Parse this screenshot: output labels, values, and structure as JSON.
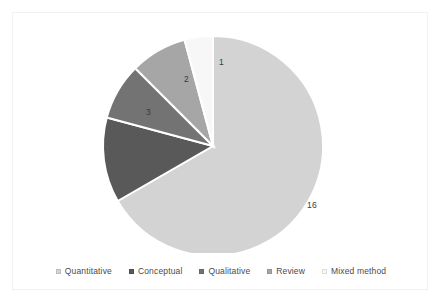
{
  "chart_data": {
    "type": "pie",
    "title": "",
    "categories": [
      "Quantitative",
      "Conceptual",
      "Qualitative",
      "Review",
      "Mixed method"
    ],
    "values": [
      16,
      3,
      2,
      2,
      1
    ],
    "labels": [
      "16",
      "3",
      "2",
      "2",
      "1"
    ],
    "colors": [
      "#d3d3d3",
      "#595959",
      "#737373",
      "#a6a6a6",
      "#f7f7f7"
    ],
    "total": 24,
    "legend_position": "bottom",
    "grid": false,
    "xlabel": "",
    "ylabel": ""
  },
  "legend": {
    "items": [
      {
        "label": "Quantitative",
        "color": "#d3d3d3"
      },
      {
        "label": "Conceptual",
        "color": "#595959"
      },
      {
        "label": "Qualitative",
        "color": "#737373"
      },
      {
        "label": "Review",
        "color": "#a6a6a6"
      },
      {
        "label": "Mixed method",
        "color": "#f7f7f7"
      }
    ]
  },
  "slice_labels": {
    "quantitative": "16",
    "conceptual": "3",
    "qualitative": "2",
    "review": "2",
    "mixed_method": "1"
  },
  "frame": {
    "border_color": "#f2f2f2",
    "background": "#ffffff"
  }
}
